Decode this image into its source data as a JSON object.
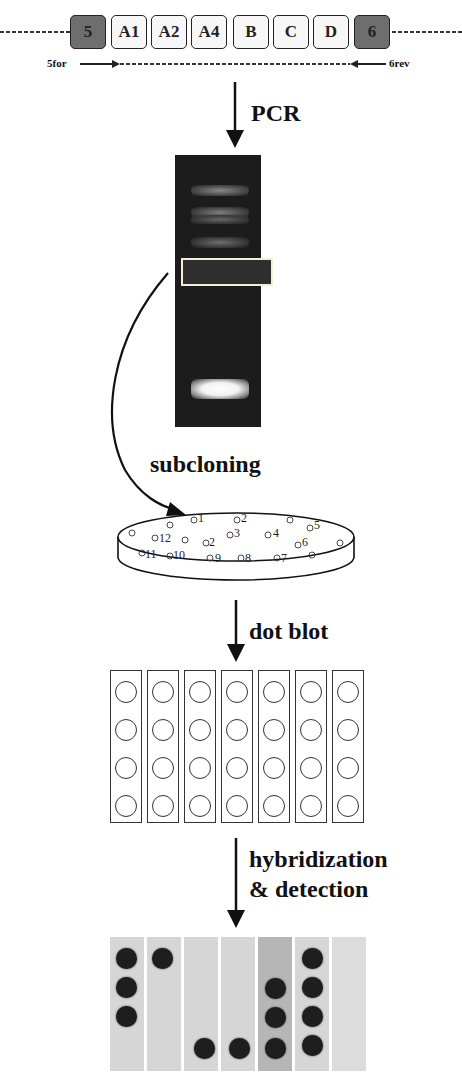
{
  "gene_construct": {
    "boxes": [
      {
        "label": "5",
        "style": "dark"
      },
      {
        "label": "A1",
        "style": "light"
      },
      {
        "label": "A2",
        "style": "light"
      },
      {
        "label": "A4",
        "style": "light"
      },
      {
        "label": "B",
        "style": "light"
      },
      {
        "label": "C",
        "style": "light"
      },
      {
        "label": "D",
        "style": "light"
      },
      {
        "label": "6",
        "style": "dark"
      }
    ],
    "forward_primer": "5for",
    "reverse_primer": "6rev"
  },
  "steps": {
    "pcr": "PCR",
    "subcloning": "subcloning",
    "dot_blot": "dot blot",
    "hybridization_line1": "hybridization",
    "hybridization_line2": "& detection"
  },
  "gel": {
    "bands": [
      "upper-1",
      "upper-2",
      "upper-3",
      "upper-4",
      "selected-region",
      "bright-lower"
    ],
    "highlight_color": "#f0f0d8"
  },
  "plate": {
    "colony_labels": [
      "1",
      "2",
      "3",
      "4",
      "5",
      "6",
      "7",
      "8",
      "9",
      "10",
      "11",
      "12",
      "2"
    ]
  },
  "dot_blot": {
    "strips": 7,
    "wells_per_strip": 4
  },
  "detection_result": {
    "signals": [
      [
        1,
        1,
        1,
        0
      ],
      [
        1,
        0,
        0,
        0
      ],
      [
        0,
        0,
        0,
        1
      ],
      [
        0,
        0,
        0,
        1
      ],
      [
        0,
        1,
        1,
        1
      ],
      [
        1,
        1,
        1,
        1
      ],
      [
        0,
        0,
        0,
        0
      ]
    ],
    "dot_color": "#1e1e1e",
    "membrane_color": "#d6d6d6"
  }
}
